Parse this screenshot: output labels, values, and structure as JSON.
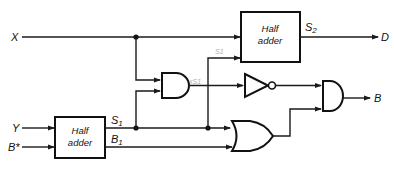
{
  "diagram": {
    "type": "logic-circuit",
    "colors": {
      "line": "#1a1a1a",
      "annotation": "#b0b0b0",
      "background": "#ffffff"
    },
    "inputs": {
      "x": "X",
      "y": "Y",
      "b_star": "B*"
    },
    "outputs": {
      "d": "D",
      "b": "B"
    },
    "blocks": {
      "half_adder_top": {
        "line1": "Half",
        "line2": "adder",
        "output_label": "S2"
      },
      "half_adder_bottom": {
        "line1": "Half",
        "line2": "adder",
        "output_s_label": "S1",
        "output_b_label": "B1"
      }
    },
    "gates": [
      "and-gate-1",
      "not-gate",
      "and-gate-2",
      "or-gate"
    ],
    "annotations": {
      "s1_handwritten": "S1",
      "xs1_handwritten": "xS1"
    }
  }
}
